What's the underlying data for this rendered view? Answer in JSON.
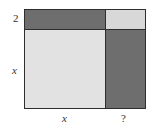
{
  "diagram": {
    "type": "area-model",
    "labels": {
      "left_top": "2",
      "left_bottom": "x",
      "bottom_left": "x",
      "bottom_right": "?"
    },
    "regions": [
      {
        "name": "top-left",
        "dims": "x by 2",
        "color": "#6e6e6e"
      },
      {
        "name": "top-right",
        "dims": "? by 2",
        "color": "#d8d8d8"
      },
      {
        "name": "bottom-left",
        "dims": "x by x",
        "color": "#e2e2e2"
      },
      {
        "name": "bottom-right",
        "dims": "? by x",
        "color": "#6e6e6e"
      }
    ],
    "colors": {
      "dark": "#6e6e6e",
      "light": "#e0e0e0",
      "border": "#2e2e2e"
    }
  }
}
